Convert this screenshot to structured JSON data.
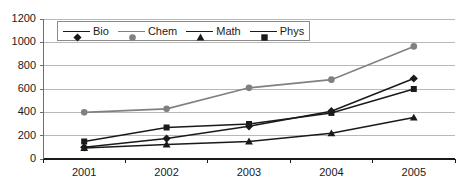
{
  "chart_data": {
    "type": "line",
    "title": "",
    "xlabel": "",
    "ylabel": "",
    "categories": [
      "2001",
      "2002",
      "2003",
      "2004",
      "2005"
    ],
    "ylim": [
      0,
      1200
    ],
    "ytick_labels": [
      "0",
      "200",
      "400",
      "600",
      "800",
      "1000",
      "1200"
    ],
    "ytick_values": [
      0,
      200,
      400,
      600,
      800,
      1000,
      1200
    ],
    "grid": true,
    "legend_position": "top-left-inside",
    "series": [
      {
        "name": "Bio",
        "marker": "diamond",
        "color": "#1a1a1a",
        "values": [
          100,
          175,
          280,
          410,
          690
        ]
      },
      {
        "name": "Chem",
        "marker": "circle",
        "color": "#808080",
        "values": [
          400,
          430,
          610,
          680,
          965
        ]
      },
      {
        "name": "Math",
        "marker": "triangle",
        "color": "#1a1a1a",
        "values": [
          95,
          125,
          150,
          220,
          355
        ]
      },
      {
        "name": "Phys",
        "marker": "square",
        "color": "#1a1a1a",
        "values": [
          150,
          270,
          300,
          395,
          600
        ]
      }
    ]
  },
  "axes": {
    "y_axis_line_color": "#6e6e6e",
    "x_axis_line_color": "#1a1a1a",
    "gridline_color": "#b0b0b0"
  },
  "legend": {
    "entries": [
      {
        "label": "Bio",
        "marker": "diamond"
      },
      {
        "label": "Chem",
        "marker": "circle"
      },
      {
        "label": "Math",
        "marker": "triangle"
      },
      {
        "label": "Phys",
        "marker": "square"
      }
    ]
  }
}
